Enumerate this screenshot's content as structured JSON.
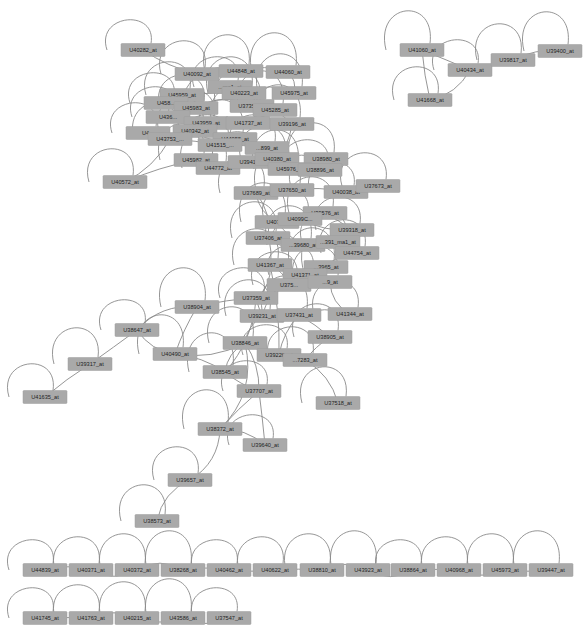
{
  "node_color": "#a9a9a9",
  "edge_color": "#8a8a8a",
  "nodes": [
    {
      "id": "U40282_at",
      "x": 143,
      "y": 50
    },
    {
      "id": "U40092_at",
      "x": 197,
      "y": 74
    },
    {
      "id": "U44848_at",
      "x": 241,
      "y": 71
    },
    {
      "id": "U44060_at",
      "x": 288,
      "y": 72
    },
    {
      "id": "U_ma1_at",
      "x": 230,
      "y": 87
    },
    {
      "id": "U45959_at",
      "x": 182,
      "y": 95
    },
    {
      "id": "U40223_at",
      "x": 244,
      "y": 93
    },
    {
      "id": "U45975_at",
      "x": 294,
      "y": 93
    },
    {
      "id": "U458_at",
      "x": 166,
      "y": 103
    },
    {
      "id": "U45983_at",
      "x": 196,
      "y": 108
    },
    {
      "id": "U37352_at",
      "x": 252,
      "y": 106
    },
    {
      "id": "U45285_at",
      "x": 275,
      "y": 110
    },
    {
      "id": "U436_at",
      "x": 168,
      "y": 117
    },
    {
      "id": "U43959_at",
      "x": 206,
      "y": 123
    },
    {
      "id": "U41737_at",
      "x": 248,
      "y": 123
    },
    {
      "id": "U39196_at",
      "x": 292,
      "y": 124
    },
    {
      "id": "U4_at",
      "x": 148,
      "y": 133
    },
    {
      "id": "U40342_at",
      "x": 195,
      "y": 131
    },
    {
      "id": "U43753_at",
      "x": 170,
      "y": 139
    },
    {
      "id": "U44058_at",
      "x": 235,
      "y": 139
    },
    {
      "id": "U41515_at",
      "x": 220,
      "y": 145
    },
    {
      "id": "U899_at",
      "x": 267,
      "y": 148
    },
    {
      "id": "U45982_at",
      "x": 196,
      "y": 160
    },
    {
      "id": "U44772_at",
      "x": 218,
      "y": 168
    },
    {
      "id": "U3941_at",
      "x": 250,
      "y": 162
    },
    {
      "id": "U40380_at",
      "x": 277,
      "y": 159
    },
    {
      "id": "U38980_at",
      "x": 326,
      "y": 159
    },
    {
      "id": "U45976_at",
      "x": 290,
      "y": 169
    },
    {
      "id": "U38896_at",
      "x": 320,
      "y": 170
    },
    {
      "id": "U40572_at",
      "x": 125,
      "y": 182
    },
    {
      "id": "U37689_at",
      "x": 256,
      "y": 193
    },
    {
      "id": "U37650_at",
      "x": 292,
      "y": 190
    },
    {
      "id": "U40038_at",
      "x": 346,
      "y": 192
    },
    {
      "id": "U37673_at",
      "x": 378,
      "y": 186
    },
    {
      "id": "U39576_at",
      "x": 325,
      "y": 213
    },
    {
      "id": "U4071_at",
      "x": 277,
      "y": 222
    },
    {
      "id": "U40990_at",
      "x": 300,
      "y": 219
    },
    {
      "id": "U39318_at",
      "x": 352,
      "y": 230
    },
    {
      "id": "U37406_at",
      "x": 268,
      "y": 238
    },
    {
      "id": "U39680_at",
      "x": 303,
      "y": 245
    },
    {
      "id": "U391_ma1_at",
      "x": 338,
      "y": 242
    },
    {
      "id": "U44754_at",
      "x": 357,
      "y": 253
    },
    {
      "id": "U41367_at",
      "x": 270,
      "y": 265
    },
    {
      "id": "U43965_at",
      "x": 326,
      "y": 267
    },
    {
      "id": "U41371_at",
      "x": 305,
      "y": 275
    },
    {
      "id": "U37526_at",
      "x": 289,
      "y": 285
    },
    {
      "id": "U10_at",
      "x": 330,
      "y": 282
    },
    {
      "id": "U38904_at",
      "x": 197,
      "y": 307
    },
    {
      "id": "U37359_at",
      "x": 256,
      "y": 298
    },
    {
      "id": "U41344_at",
      "x": 350,
      "y": 314
    },
    {
      "id": "U39231_at",
      "x": 262,
      "y": 316
    },
    {
      "id": "U37431_at",
      "x": 299,
      "y": 315
    },
    {
      "id": "U38647_at",
      "x": 137,
      "y": 330
    },
    {
      "id": "U38905_at",
      "x": 330,
      "y": 337
    },
    {
      "id": "U38846_at",
      "x": 245,
      "y": 343
    },
    {
      "id": "U40490_at",
      "x": 175,
      "y": 354
    },
    {
      "id": "U39226_at",
      "x": 279,
      "y": 355
    },
    {
      "id": "U37283_at",
      "x": 305,
      "y": 360
    },
    {
      "id": "U39317_at",
      "x": 90,
      "y": 364
    },
    {
      "id": "U38545_at",
      "x": 225,
      "y": 372
    },
    {
      "id": "U37707_at",
      "x": 259,
      "y": 391
    },
    {
      "id": "U41635_at",
      "x": 45,
      "y": 397
    },
    {
      "id": "U37518_at",
      "x": 338,
      "y": 403
    },
    {
      "id": "U38372_at",
      "x": 220,
      "y": 429
    },
    {
      "id": "U39640_at",
      "x": 265,
      "y": 445
    },
    {
      "id": "U39657_at",
      "x": 190,
      "y": 480
    },
    {
      "id": "U38573_at",
      "x": 157,
      "y": 521
    },
    {
      "id": "U41060_at",
      "x": 422,
      "y": 50
    },
    {
      "id": "U40434_at",
      "x": 470,
      "y": 70
    },
    {
      "id": "U41668_at",
      "x": 430,
      "y": 100
    },
    {
      "id": "U39817_at",
      "x": 513,
      "y": 60
    },
    {
      "id": "U39400_at",
      "x": 560,
      "y": 51
    },
    {
      "id": "U44839_at",
      "x": 45,
      "y": 570
    },
    {
      "id": "U40371_at",
      "x": 91,
      "y": 570
    },
    {
      "id": "U40372_at",
      "x": 137,
      "y": 570
    },
    {
      "id": "U38268_at",
      "x": 183,
      "y": 570
    },
    {
      "id": "U40462_at",
      "x": 229,
      "y": 570
    },
    {
      "id": "U40622_at",
      "x": 275,
      "y": 570
    },
    {
      "id": "U38810_at",
      "x": 322,
      "y": 570
    },
    {
      "id": "U43923_at",
      "x": 368,
      "y": 570
    },
    {
      "id": "U38864_at",
      "x": 413,
      "y": 570
    },
    {
      "id": "U40968_at",
      "x": 459,
      "y": 570
    },
    {
      "id": "U45973_at",
      "x": 505,
      "y": 570
    },
    {
      "id": "U39447_at",
      "x": 551,
      "y": 570
    },
    {
      "id": "U41745_at",
      "x": 45,
      "y": 618
    },
    {
      "id": "U41763_at",
      "x": 91,
      "y": 618
    },
    {
      "id": "U40215_at",
      "x": 137,
      "y": 618
    },
    {
      "id": "U43586_at",
      "x": 183,
      "y": 618
    },
    {
      "id": "U37547_at",
      "x": 229,
      "y": 618
    }
  ],
  "labels": {
    "U40282_at": "U40282_at",
    "U40092_at": "U40092_at",
    "U44848_at": "U44848_at",
    "U44060_at": "U44060_at",
    "U_ma1_at": "...ma1_at",
    "U45959_at": "U45959_at",
    "U40223_at": "U40223_at",
    "U45975_at": "U45975_at",
    "U458_at": "U458...",
    "U45983_at": "U45983_at",
    "U37352_at": "U37352_...",
    "U45285_at": "U45285_at",
    "U436_at": "U436...",
    "U43959_at": "U43959_at",
    "U41737_at": "U41737_at",
    "U39196_at": "U39196_at",
    "U4_at": "U4...",
    "U40342_at": "U40342_at",
    "U43753_at": "U43753_...",
    "U44058_at": "U44058_at",
    "U41515_at": "U41515_...",
    "U899_at": "...899_at",
    "U45982_at": "U45982_at",
    "U44772_at": "U44772_at",
    "U3941_at": "U3941...",
    "U40380_at": "U40380_at",
    "U38980_at": "U38980_at",
    "U45976_at": "U45976_at",
    "U38896_at": "U38896_at",
    "U40572_at": "U40572_at",
    "U37689_at": "U37689_at",
    "U37650_at": "U37650_at",
    "U40038_at": "U40038_at",
    "U37673_at": "U37673_at",
    "U39576_at": "U39576_at",
    "U4071_at": "U4071...",
    "U40990_at": "U4099C...",
    "U39318_at": "U39318_at",
    "U37406_at": "U37406_at",
    "U39680_at": "...39680_at",
    "U391_ma1_at": "...391_ma1_at",
    "U44754_at": "U44754_at",
    "U41367_at": "U41367_at",
    "U43965_at": "...3965_at",
    "U41371_at": "U41371_at",
    "U37526_at": "U375...",
    "U10_at": "...9_at",
    "U38904_at": "U38904_at",
    "U37359_at": "U37359_at",
    "U41344_at": "U41344_at",
    "U39231_at": "U39231_at",
    "U37431_at": "U37431_at",
    "U38647_at": "U38647_at",
    "U38905_at": "U38905_at",
    "U38846_at": "U38846_at",
    "U40490_at": "U40490_at",
    "U39226_at": "U39226_at",
    "U37283_at": "...7283_at",
    "U39317_at": "U39317_at",
    "U38545_at": "U38545_at",
    "U37707_at": "U37707_at",
    "U41635_at": "U41635_at",
    "U37518_at": "U37518_at",
    "U38372_at": "U38372_at",
    "U39640_at": "U39640_at",
    "U39657_at": "U39657_at",
    "U38573_at": "U38573_at",
    "U41060_at": "U41060_at",
    "U40434_at": "U40434_at",
    "U41668_at": "U41668_at",
    "U39817_at": "U39817_at",
    "U39400_at": "U39400_at",
    "U44839_at": "U44839_at",
    "U40371_at": "U40371_at",
    "U40372_at": "U40372_at",
    "U38268_at": "U38268_at",
    "U40462_at": "U40462_at",
    "U40622_at": "U40622_at",
    "U38810_at": "U38810_at",
    "U43923_at": "U43923_at",
    "U38864_at": "U38864_at",
    "U40968_at": "U40968_at",
    "U45973_at": "U45973_at",
    "U39447_at": "U39447_at",
    "U41745_at": "U41745_at",
    "U41763_at": "U41763_at",
    "U40215_at": "U40215_at",
    "U43586_at": "U43586_at",
    "U37547_at": "U37547_at"
  },
  "edges": [
    [
      "U41060_at",
      "U40434_at"
    ],
    [
      "U41060_at",
      "U41668_at"
    ],
    [
      "U40434_at",
      "U41668_at"
    ],
    [
      "U39817_at",
      "U39400_at"
    ],
    [
      "U41635_at",
      "U39317_at"
    ],
    [
      "U39317_at",
      "U38647_at"
    ],
    [
      "U38647_at",
      "U38904_at"
    ],
    [
      "U38647_at",
      "U40490_at"
    ],
    [
      "U38904_at",
      "U40490_at"
    ],
    [
      "U38904_at",
      "U37359_at"
    ],
    [
      "U40490_at",
      "U38545_at"
    ],
    [
      "U40490_at",
      "U38846_at"
    ],
    [
      "U38545_at",
      "U37707_at"
    ],
    [
      "U38545_at",
      "U38846_at"
    ],
    [
      "U38846_at",
      "U39226_at"
    ],
    [
      "U38846_at",
      "U37707_at"
    ],
    [
      "U39226_at",
      "U37283_at"
    ],
    [
      "U37283_at",
      "U37518_at"
    ],
    [
      "U37707_at",
      "U38372_at"
    ],
    [
      "U37707_at",
      "U39640_at"
    ],
    [
      "U38372_at",
      "U39640_at"
    ],
    [
      "U38372_at",
      "U39657_at"
    ],
    [
      "U39657_at",
      "U38573_at"
    ],
    [
      "U38372_at",
      "U38846_at"
    ],
    [
      "U39231_at",
      "U37431_at"
    ],
    [
      "U39231_at",
      "U37359_at"
    ],
    [
      "U37359_at",
      "U41367_at"
    ],
    [
      "U37431_at",
      "U41344_at"
    ],
    [
      "U37431_at",
      "U38905_at"
    ],
    [
      "U41367_at",
      "U41371_at"
    ],
    [
      "U41371_at",
      "U43965_at"
    ],
    [
      "U41371_at",
      "U10_at"
    ],
    [
      "U41367_at",
      "U37526_at"
    ],
    [
      "U37406_at",
      "U39680_at"
    ],
    [
      "U39680_at",
      "U391_ma1_at"
    ],
    [
      "U391_ma1_at",
      "U44754_at"
    ],
    [
      "U39318_at",
      "U39576_at"
    ],
    [
      "U4071_at",
      "U40990_at"
    ],
    [
      "U40990_at",
      "U39576_at"
    ],
    [
      "U37406_at",
      "U4071_at"
    ],
    [
      "U37689_at",
      "U37650_at"
    ],
    [
      "U37650_at",
      "U40038_at"
    ],
    [
      "U40038_at",
      "U37673_at"
    ],
    [
      "U37689_at",
      "U4071_at"
    ],
    [
      "U40380_at",
      "U38980_at"
    ],
    [
      "U45976_at",
      "U38896_at"
    ],
    [
      "U3941_at",
      "U40380_at"
    ],
    [
      "U44772_at",
      "U3941_at"
    ],
    [
      "U45982_at",
      "U44772_at"
    ],
    [
      "U40572_at",
      "U45982_at"
    ],
    [
      "U40572_at",
      "U43753_at"
    ],
    [
      "U40282_at",
      "U40092_at"
    ],
    [
      "U40092_at",
      "U44848_at"
    ],
    [
      "U44848_at",
      "U44060_at"
    ],
    [
      "U45959_at",
      "U40223_at"
    ],
    [
      "U40223_at",
      "U45975_at"
    ],
    [
      "U45983_at",
      "U37352_at"
    ],
    [
      "U37352_at",
      "U45285_at"
    ],
    [
      "U43959_at",
      "U41737_at"
    ],
    [
      "U41737_at",
      "U39196_at"
    ],
    [
      "U40342_at",
      "U44058_at"
    ],
    [
      "U44058_at",
      "U899_at"
    ],
    [
      "U41515_at",
      "U899_at"
    ],
    [
      "U458_at",
      "U45983_at"
    ],
    [
      "U436_at",
      "U43959_at"
    ],
    [
      "U4_at",
      "U40342_at"
    ],
    [
      "U43753_at",
      "U41515_at"
    ],
    [
      "U45285_at",
      "U39196_at"
    ],
    [
      "U39196_at",
      "U40380_at"
    ],
    [
      "U899_at",
      "U45976_at"
    ],
    [
      "U45976_at",
      "U37650_at"
    ],
    [
      "U37689_at",
      "U37406_at"
    ],
    [
      "U37406_at",
      "U41367_at"
    ],
    [
      "U39680_at",
      "U41371_at"
    ],
    [
      "U44754_at",
      "U43965_at"
    ],
    [
      "U10_at",
      "U41344_at"
    ],
    [
      "U37526_at",
      "U39231_at"
    ],
    [
      "U39231_at",
      "U38846_at"
    ],
    [
      "U37431_at",
      "U39226_at"
    ],
    [
      "U38905_at",
      "U37283_at"
    ],
    [
      "U40092_at",
      "U45959_at"
    ],
    [
      "U44060_at",
      "U45975_at"
    ],
    [
      "U_ma1_at",
      "U40223_at"
    ],
    [
      "U45959_at",
      "U458_at"
    ],
    [
      "U37359_at",
      "U38545_at"
    ],
    [
      "U41367_at",
      "U39226_at"
    ],
    [
      "U4071_at",
      "U39680_at"
    ],
    [
      "U40990_at",
      "U39318_at"
    ],
    [
      "U44839_at",
      "U40371_at"
    ],
    [
      "U40371_at",
      "U40372_at"
    ],
    [
      "U40372_at",
      "U38268_at"
    ],
    [
      "U38268_at",
      "U40462_at"
    ],
    [
      "U40462_at",
      "U40622_at"
    ],
    [
      "U40622_at",
      "U38810_at"
    ],
    [
      "U38810_at",
      "U43923_at"
    ],
    [
      "U43923_at",
      "U38864_at"
    ],
    [
      "U38864_at",
      "U40968_at"
    ],
    [
      "U40968_at",
      "U45973_at"
    ],
    [
      "U45973_at",
      "U39447_at"
    ],
    [
      "U41745_at",
      "U41763_at"
    ],
    [
      "U41763_at",
      "U40215_at"
    ],
    [
      "U40215_at",
      "U43586_at"
    ],
    [
      "U43586_at",
      "U37547_at"
    ]
  ]
}
